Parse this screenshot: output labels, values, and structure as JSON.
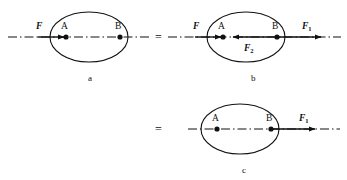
{
  "figure": {
    "background": "#ffffff",
    "stroke_color": "#111111",
    "panels": [
      {
        "caption": "a",
        "caption_x": 88,
        "caption_y": 74,
        "ellipse": {
          "cx": 89,
          "cy": 37,
          "rx": 39,
          "ry": 25
        },
        "axis": {
          "x1": 8,
          "x2": 150,
          "y": 37
        },
        "points": [
          {
            "label": "A",
            "x": 66,
            "y": 37,
            "label_x": 61,
            "label_y": 22
          },
          {
            "label": "B",
            "x": 120,
            "y": 37,
            "label_x": 115,
            "label_y": 22
          }
        ],
        "vectors": [
          {
            "name": "F",
            "label": "F",
            "subscript": "",
            "x1": 38,
            "x2": 66,
            "y": 37,
            "direction": "right",
            "label_x": 36,
            "label_y": 22
          }
        ]
      },
      {
        "caption": "b",
        "caption_x": 251,
        "caption_y": 74,
        "ellipse": {
          "cx": 246,
          "cy": 37,
          "rx": 39,
          "ry": 25
        },
        "axis": {
          "x1": 168,
          "x2": 341,
          "y": 37
        },
        "points": [
          {
            "label": "A",
            "x": 223,
            "y": 37,
            "label_x": 218,
            "label_y": 22
          },
          {
            "label": "B",
            "x": 277,
            "y": 37,
            "label_x": 272,
            "label_y": 22
          }
        ],
        "vectors": [
          {
            "name": "F",
            "label": "F",
            "subscript": "",
            "x1": 195,
            "x2": 223,
            "y": 37,
            "direction": "right",
            "label_x": 193,
            "label_y": 22
          },
          {
            "name": "F2",
            "label": "F",
            "subscript": "2",
            "x1": 277,
            "x2": 231,
            "y": 37,
            "direction": "left",
            "label_x": 246,
            "label_y": 44
          },
          {
            "name": "F1",
            "label": "F",
            "subscript": "1",
            "x1": 277,
            "x2": 323,
            "y": 37,
            "direction": "right",
            "label_x": 303,
            "label_y": 22
          }
        ]
      },
      {
        "caption": "c",
        "caption_x": 242,
        "caption_y": 166,
        "ellipse": {
          "cx": 240,
          "cy": 129,
          "rx": 39,
          "ry": 25
        },
        "axis": {
          "x1": 188,
          "x2": 340,
          "y": 129
        },
        "points": [
          {
            "label": "A",
            "x": 217,
            "y": 129,
            "label_x": 212,
            "label_y": 114
          },
          {
            "label": "B",
            "x": 271,
            "y": 129,
            "label_x": 266,
            "label_y": 114
          }
        ],
        "vectors": [
          {
            "name": "F1",
            "label": "F",
            "subscript": "1",
            "x1": 271,
            "x2": 317,
            "y": 129,
            "direction": "right",
            "label_x": 300,
            "label_y": 114
          }
        ]
      }
    ],
    "equals_signs": [
      {
        "text": "=",
        "x": 155,
        "y": 31
      },
      {
        "text": "=",
        "x": 155,
        "y": 123
      }
    ]
  }
}
